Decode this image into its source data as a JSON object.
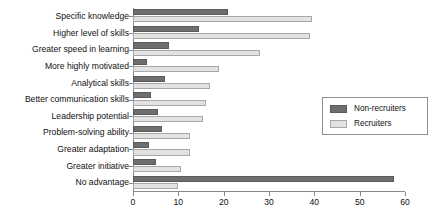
{
  "chart_data": {
    "type": "bar",
    "orientation": "horizontal",
    "title": "",
    "subtitle": "",
    "xlabel": "",
    "ylabel": "",
    "xlim": [
      0,
      60
    ],
    "ylim": null,
    "grid": false,
    "legend_position": "right",
    "xticks": [
      0,
      10,
      20,
      30,
      40,
      50,
      60
    ],
    "xtick_labels": [
      "0",
      "10",
      "20",
      "30",
      "40",
      "50",
      "60"
    ],
    "categories": [
      "Specific knowledge",
      "Higher level of skills",
      "Greater speed in learning",
      "More highly motivated",
      "Analytical skills",
      "Better communication skills",
      "Leadership potential",
      "Problem-solving ability",
      "Greater adaptation",
      "Greater initiative",
      "No advantage"
    ],
    "series": [
      {
        "name": "Non-recruiters",
        "color": "#6e6e6e",
        "values": [
          21,
          14.5,
          8,
          3,
          7,
          4,
          5.5,
          6.5,
          3.5,
          5,
          57.5
        ]
      },
      {
        "name": "Recruiters",
        "color": "#e2e2e2",
        "values": [
          39.5,
          39,
          28,
          19,
          17,
          16,
          15.5,
          12.5,
          12.5,
          10.5,
          10
        ]
      }
    ]
  },
  "legend": {
    "entries": [
      {
        "label": "Non-recruiters",
        "swatch": "dark"
      },
      {
        "label": "Recruiters",
        "swatch": "light"
      }
    ]
  }
}
